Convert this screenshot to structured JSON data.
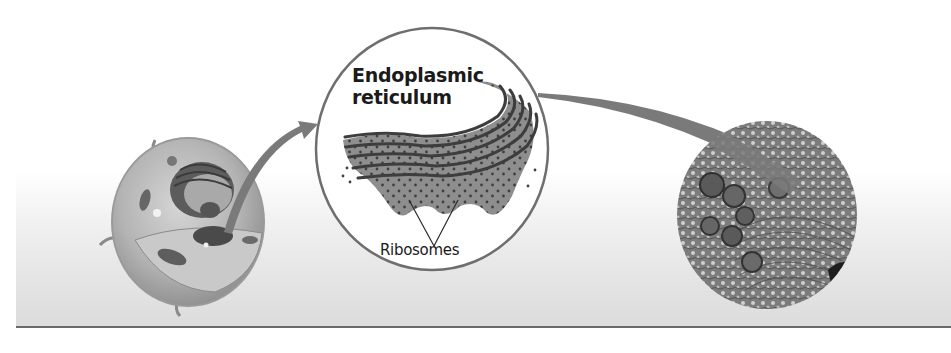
{
  "figure": {
    "panels": [
      {
        "id": "cell",
        "description": "3D cutaway illustration of a eukaryotic animal cell"
      },
      {
        "id": "magnified",
        "description": "Magnified view of rough endoplasmic reticulum"
      },
      {
        "id": "micrograph",
        "description": "Circular electron micrograph of endoplasmic reticulum"
      }
    ],
    "labels": {
      "er_title": "Endoplasmic reticulum",
      "er_title_line1": "Endoplasmic",
      "er_title_line2": "reticulum",
      "ribosomes": "Ribosomes"
    },
    "colors": {
      "arrow": "#7a7a7a",
      "circle_outline": "#6e6e6e",
      "er_fill": "#8e8e8e",
      "er_membrane": "#3d3d3d",
      "ribosome_dot": "#4a4a4a",
      "band_top": "#ffffff",
      "band_bottom": "#dcdcdc",
      "baseline": "#6a6a6a"
    }
  }
}
